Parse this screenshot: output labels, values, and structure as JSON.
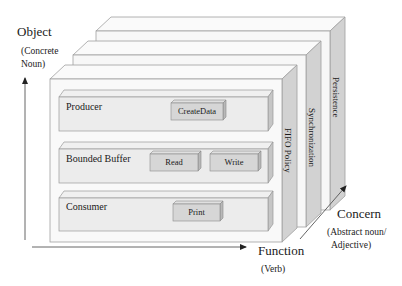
{
  "axes": {
    "object": {
      "title": "Object",
      "subtitle_line1": "(Concrete",
      "subtitle_line2": "Noun)"
    },
    "function": {
      "title": "Function",
      "subtitle": "(Verb)"
    },
    "concern": {
      "title": "Concern",
      "subtitle_line1": "(Abstract noun/",
      "subtitle_line2": "Adjective)"
    }
  },
  "layers": [
    {
      "name": "FIFO Policy"
    },
    {
      "name": "Synchronization"
    },
    {
      "name": "Persistence"
    }
  ],
  "objects": [
    {
      "name": "Producer",
      "functions": [
        "CreateData"
      ]
    },
    {
      "name": "Bounded Buffer",
      "functions": [
        "Read",
        "Write"
      ]
    },
    {
      "name": "Consumer",
      "functions": [
        "Print"
      ]
    }
  ],
  "colors": {
    "layer_face": "#f7f7f7",
    "layer_side": "#cfcfcf",
    "bar_face": "#ececec",
    "bar_side": "#c4c4c4",
    "button_face": "#d6d6d6",
    "edge": "#9a9a9a",
    "axis": "#333333"
  }
}
